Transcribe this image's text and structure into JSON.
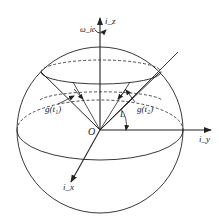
{
  "diagram": {
    "type": "sphere-coordinate-diagram",
    "labels": {
      "z_axis": "i_z",
      "y_axis": "i_y",
      "x_axis": "i_x",
      "origin": "O",
      "omega": "ω_ie",
      "angle": "L",
      "g_t1": "g(t₁)",
      "g_t2": "g(t₂)"
    },
    "colors": {
      "stroke": "#222222",
      "background": "#ffffff"
    }
  }
}
